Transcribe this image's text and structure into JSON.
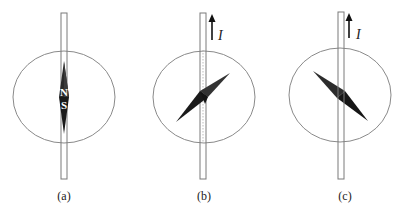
{
  "figure": {
    "panels": [
      {
        "id": "a",
        "caption": "(a)",
        "current_arrow": false,
        "needle_poles": {
          "north": "N",
          "south": "S"
        },
        "needle_orientation": "vertical (north-south, no current)"
      },
      {
        "id": "b",
        "caption": "(b)",
        "current_arrow": true,
        "current_label": "I",
        "needle_orientation": "deflected clockwise (tip toward upper right)"
      },
      {
        "id": "c",
        "caption": "(c)",
        "current_arrow": true,
        "current_label": "I",
        "needle_orientation": "deflected counter-clockwise (tip toward upper left)"
      }
    ],
    "colors": {
      "line": "#888888",
      "needle_dark": "#1a1a1a",
      "needle_mid": "#333333",
      "text": "#222222"
    }
  }
}
